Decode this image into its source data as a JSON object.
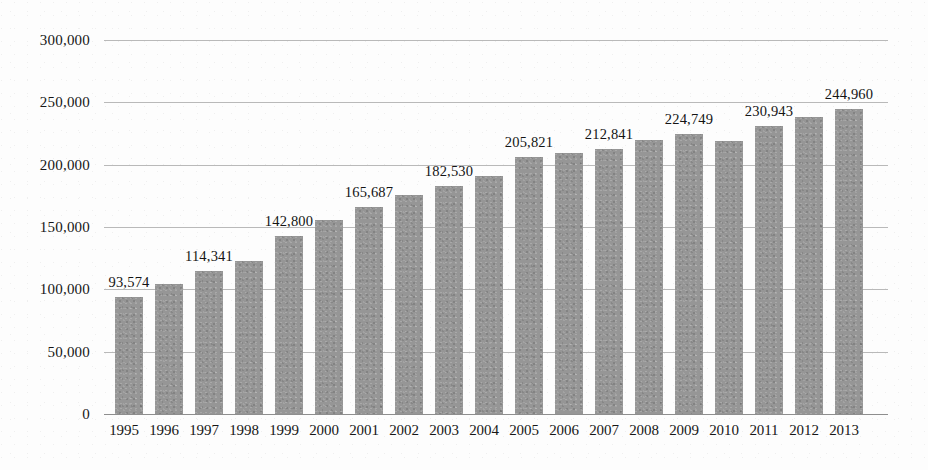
{
  "chart_data": {
    "type": "bar",
    "title": "",
    "xlabel": "",
    "ylabel": "",
    "ylim": [
      0,
      300000
    ],
    "grid": true,
    "legend": "none",
    "categories": [
      "1995",
      "1996",
      "1997",
      "1998",
      "1999",
      "2000",
      "2001",
      "2002",
      "2003",
      "2004",
      "2005",
      "2006",
      "2007",
      "2008",
      "2009",
      "2010",
      "2011",
      "2012",
      "2013"
    ],
    "values": [
      93574,
      104000,
      114341,
      123000,
      142800,
      155500,
      165687,
      176000,
      182530,
      191000,
      205821,
      209500,
      212841,
      219500,
      224749,
      219000,
      230943,
      238000,
      244960
    ],
    "point_labels": [
      "93,574",
      "",
      "114,341",
      "",
      "142,800",
      "",
      "165,687",
      "",
      "182,530",
      "",
      "205,821",
      "",
      "212,841",
      "",
      "224,749",
      "",
      "230,943",
      "",
      "244,960"
    ],
    "ytick_labels": [
      "300,000",
      "250,000",
      "200,000",
      "150,000",
      "100,000",
      "50,000",
      "0"
    ],
    "ytick_values": [
      300000,
      250000,
      200000,
      150000,
      100000,
      50000,
      0
    ],
    "bar_color": "#969696",
    "gridline_color": "#b9b9b9",
    "axis_color": "#8e8e8e"
  }
}
